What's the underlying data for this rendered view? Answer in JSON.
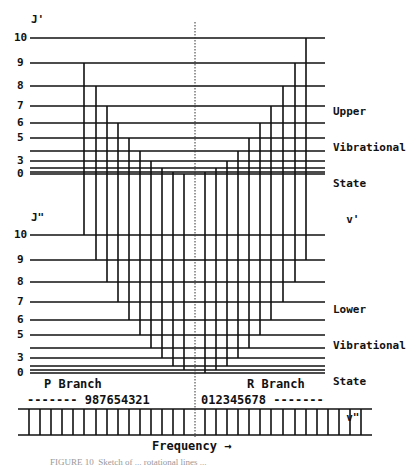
{
  "diagram": {
    "upper_axis_label": "J'",
    "lower_axis_label": "J\"",
    "upper_levels": [
      {
        "J": 10,
        "label": "10",
        "y": 38
      },
      {
        "J": 9,
        "label": "9",
        "y": 63
      },
      {
        "J": 8,
        "label": "8",
        "y": 86
      },
      {
        "J": 7,
        "label": "7",
        "y": 106
      },
      {
        "J": 6,
        "label": "6",
        "y": 123
      },
      {
        "J": 5,
        "label": "5",
        "y": 138
      },
      {
        "J": 4,
        "label": "",
        "y": 151
      },
      {
        "J": 3,
        "label": "3",
        "y": 161
      },
      {
        "J": 2,
        "label": "",
        "y": 168
      },
      {
        "J": 1,
        "label": "",
        "y": 172
      },
      {
        "J": 0,
        "label": "0",
        "y": 174
      }
    ],
    "lower_levels": [
      {
        "J": 10,
        "label": "10",
        "y": 235
      },
      {
        "J": 9,
        "label": "9",
        "y": 260
      },
      {
        "J": 8,
        "label": "8",
        "y": 282
      },
      {
        "J": 7,
        "label": "7",
        "y": 302
      },
      {
        "J": 6,
        "label": "6",
        "y": 320
      },
      {
        "J": 5,
        "label": "5",
        "y": 335
      },
      {
        "J": 4,
        "label": "",
        "y": 348
      },
      {
        "J": 3,
        "label": "3",
        "y": 358
      },
      {
        "J": 2,
        "label": "",
        "y": 366
      },
      {
        "J": 1,
        "label": "",
        "y": 370
      },
      {
        "J": 0,
        "label": "0",
        "y": 373
      }
    ],
    "upper_state_label": [
      "Upper",
      "Vibrational",
      "State",
      "  v'"
    ],
    "lower_state_label": [
      "Lower",
      "Vibrational",
      "State",
      "  v\""
    ],
    "p_branch": {
      "title": "P Branch",
      "numbers": "------- 987654321",
      "transitions": [
        {
          "from_J_upper": 9,
          "to_J_lower": 10,
          "x": 84
        },
        {
          "from_J_upper": 8,
          "to_J_lower": 9,
          "x": 96
        },
        {
          "from_J_upper": 7,
          "to_J_lower": 8,
          "x": 107
        },
        {
          "from_J_upper": 6,
          "to_J_lower": 7,
          "x": 118
        },
        {
          "from_J_upper": 5,
          "to_J_lower": 6,
          "x": 129
        },
        {
          "from_J_upper": 4,
          "to_J_lower": 5,
          "x": 140
        },
        {
          "from_J_upper": 3,
          "to_J_lower": 4,
          "x": 151
        },
        {
          "from_J_upper": 2,
          "to_J_lower": 3,
          "x": 162
        },
        {
          "from_J_upper": 1,
          "to_J_lower": 2,
          "x": 173
        },
        {
          "from_J_upper": 0,
          "to_J_lower": 1,
          "x": 184
        }
      ]
    },
    "r_branch": {
      "title": "R Branch",
      "numbers": "012345678 -------",
      "transitions": [
        {
          "from_J_upper": 1,
          "to_J_lower": 0,
          "x": 205
        },
        {
          "from_J_upper": 2,
          "to_J_lower": 1,
          "x": 216
        },
        {
          "from_J_upper": 3,
          "to_J_lower": 2,
          "x": 227
        },
        {
          "from_J_upper": 4,
          "to_J_lower": 3,
          "x": 238
        },
        {
          "from_J_upper": 5,
          "to_J_lower": 4,
          "x": 249
        },
        {
          "from_J_upper": 6,
          "to_J_lower": 5,
          "x": 260
        },
        {
          "from_J_upper": 7,
          "to_J_lower": 6,
          "x": 271
        },
        {
          "from_J_upper": 8,
          "to_J_lower": 7,
          "x": 283
        },
        {
          "from_J_upper": 9,
          "to_J_lower": 8,
          "x": 295
        },
        {
          "from_J_upper": 10,
          "to_J_lower": 9,
          "x": 306
        }
      ]
    },
    "band_origin_x": 195,
    "spectrum": {
      "top_y": 409,
      "bottom_y": 435,
      "left_x": 18,
      "right_x": 372,
      "line_xs": [
        29,
        40,
        51,
        62,
        73,
        84,
        96,
        107,
        118,
        129,
        140,
        151,
        162,
        173,
        184,
        205,
        216,
        227,
        238,
        249,
        260,
        271,
        283,
        295,
        306,
        317,
        328,
        339,
        350,
        361
      ]
    },
    "frequency_label": "Frequency →",
    "caption": "FIGURE 10  Sketch of ... rotational lines ..."
  }
}
